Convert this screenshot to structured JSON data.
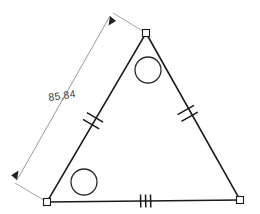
{
  "drawing": {
    "title": "Triangle with dimension annotation",
    "background_color": "#ffffff",
    "line_color": "#1a1a1a",
    "dimension_color": "#8d8d8d",
    "text_color": "#3d3d3d"
  },
  "dimension": {
    "value_label": "85,84",
    "unit_style": "decimal-comma",
    "arrow_style": "filled-arrowhead",
    "measures_edge": "left-edge"
  },
  "triangle": {
    "vertices": [
      {
        "name": "apex",
        "x": 146,
        "y": 33
      },
      {
        "name": "bottom-left",
        "x": 47,
        "y": 202
      },
      {
        "name": "bottom-right",
        "x": 240,
        "y": 200
      }
    ],
    "edges": [
      {
        "name": "left-edge",
        "from": "apex",
        "to": "bottom-left",
        "tick_count": 2
      },
      {
        "name": "right-edge",
        "from": "apex",
        "to": "bottom-right",
        "tick_count": 2
      },
      {
        "name": "bottom-edge",
        "from": "bottom-left",
        "to": "bottom-right",
        "tick_count": 3
      }
    ]
  },
  "circles": [
    {
      "name": "upper-circle",
      "cx": 148,
      "cy": 70,
      "r": 13
    },
    {
      "name": "lower-left-circle",
      "cx": 84,
      "cy": 182,
      "r": 13
    }
  ]
}
